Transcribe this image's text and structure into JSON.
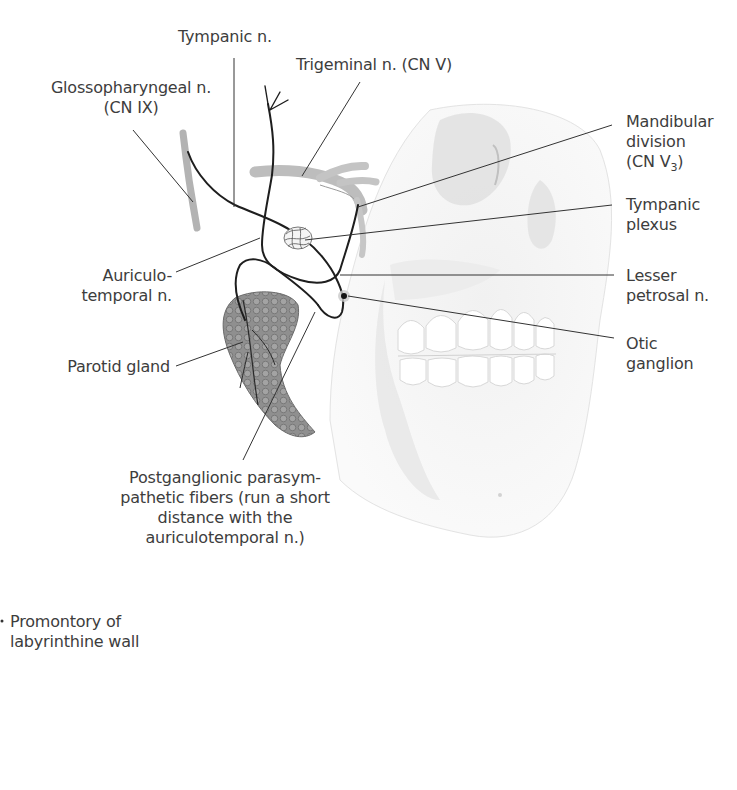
{
  "figure": {
    "colors": {
      "label_text": "#3d3d3d",
      "leader_line": "#333333",
      "nerve": "#1e1e1e",
      "skull": "#e6e6e6",
      "parotid": "#8a8a8a"
    }
  },
  "labels": {
    "tympanic_n": {
      "lines": [
        "Tympanic n."
      ]
    },
    "trigeminal_n": {
      "lines": [
        "Trigeminal n. (CN V)"
      ]
    },
    "glossopharyngeal_n": {
      "lines": [
        "Glossopharyngeal n.",
        "(CN IX)"
      ]
    },
    "mandibular_division": {
      "lines": [
        "Mandibular",
        "division",
        "(CN V",
        "3",
        ")"
      ]
    },
    "tympanic_plexus": {
      "lines": [
        "Tympanic",
        "plexus"
      ]
    },
    "auriculotemporal_n": {
      "lines": [
        "Auriculo-",
        "temporal n."
      ]
    },
    "lesser_petrosal_n": {
      "lines": [
        "Lesser",
        "petrosal n."
      ]
    },
    "otic_ganglion": {
      "lines": [
        "Otic",
        "ganglion"
      ]
    },
    "parotid_gland": {
      "lines": [
        "Parotid gland"
      ]
    },
    "postganglionic_fibers": {
      "lines": [
        "Postganglionic parasym-",
        "pathetic fibers (run a short",
        "distance with the",
        "auriculotemporal n.)"
      ]
    },
    "promontory": {
      "lines": [
        "Promontory of",
        "labyrinthine wall"
      ]
    }
  }
}
